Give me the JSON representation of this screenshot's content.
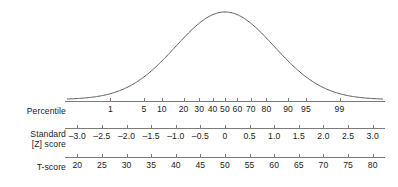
{
  "chart_data": {
    "type": "line",
    "title": "",
    "subtitle": "",
    "xlabel": "",
    "ylabel": "",
    "grid": false,
    "legend": null,
    "curve": {
      "name": "normal-distribution",
      "mean_z": 0,
      "sd_z": 1,
      "xlim_z": [
        -3.2,
        3.2
      ],
      "color": "#5a5a5a",
      "filled": false
    },
    "series": [
      {
        "name": "Percentile",
        "values": [
          1,
          5,
          10,
          20,
          30,
          40,
          50,
          60,
          70,
          80,
          90,
          95,
          99
        ],
        "z_positions": [
          -2.326,
          -1.645,
          -1.282,
          -0.842,
          -0.524,
          -0.253,
          0,
          0.253,
          0.524,
          0.842,
          1.282,
          1.645,
          2.326
        ]
      },
      {
        "name": "Standard [Z] score",
        "values": [
          "–3.0",
          "–2.5",
          "–2.0",
          "–1.5",
          "–1.0",
          "–0.5",
          "0",
          "0.5",
          "1.0",
          "1.5",
          "2.0",
          "2.5",
          "3.0"
        ],
        "z_positions": [
          -3.0,
          -2.5,
          -2.0,
          -1.5,
          -1.0,
          -0.5,
          0,
          0.5,
          1.0,
          1.5,
          2.0,
          2.5,
          3.0
        ]
      },
      {
        "name": "T-score",
        "values": [
          20,
          25,
          30,
          35,
          40,
          45,
          50,
          55,
          60,
          65,
          70,
          75,
          80
        ],
        "z_positions": [
          -3.0,
          -2.5,
          -2.0,
          -1.5,
          -1.0,
          -0.5,
          0,
          0.5,
          1.0,
          1.5,
          2.0,
          2.5,
          3.0
        ]
      }
    ]
  },
  "rows": [
    {
      "id": "percentile",
      "label": "Percentile",
      "label_line2": "",
      "ticks": [
        {
          "value": "1",
          "z": -2.326
        },
        {
          "value": "5",
          "z": -1.645
        },
        {
          "value": "10",
          "z": -1.282
        },
        {
          "value": "20",
          "z": -0.842
        },
        {
          "value": "30",
          "z": -0.524
        },
        {
          "value": "40",
          "z": -0.253
        },
        {
          "value": "50",
          "z": 0
        },
        {
          "value": "60",
          "z": 0.253
        },
        {
          "value": "70",
          "z": 0.524
        },
        {
          "value": "80",
          "z": 0.842
        },
        {
          "value": "90",
          "z": 1.282
        },
        {
          "value": "95",
          "z": 1.645
        },
        {
          "value": "99",
          "z": 2.326
        }
      ]
    },
    {
      "id": "zscore",
      "label": "Standard",
      "label_line2": "[Z] score",
      "ticks": [
        {
          "value": "–3.0",
          "z": -3.0
        },
        {
          "value": "–2.5",
          "z": -2.5
        },
        {
          "value": "–2.0",
          "z": -2.0
        },
        {
          "value": "–1.5",
          "z": -1.5
        },
        {
          "value": "–1.0",
          "z": -1.0
        },
        {
          "value": "–0.5",
          "z": -0.5
        },
        {
          "value": "0",
          "z": 0
        },
        {
          "value": "0.5",
          "z": 0.5
        },
        {
          "value": "1.0",
          "z": 1.0
        },
        {
          "value": "1.5",
          "z": 1.5
        },
        {
          "value": "2.0",
          "z": 2.0
        },
        {
          "value": "2.5",
          "z": 2.5
        },
        {
          "value": "3.0",
          "z": 3.0
        }
      ]
    },
    {
      "id": "tscore",
      "label": "T-score",
      "label_line2": "",
      "ticks": [
        {
          "value": "20",
          "z": -3.0
        },
        {
          "value": "25",
          "z": -2.5
        },
        {
          "value": "30",
          "z": -2.0
        },
        {
          "value": "35",
          "z": -1.5
        },
        {
          "value": "40",
          "z": -1.0
        },
        {
          "value": "45",
          "z": -0.5
        },
        {
          "value": "50",
          "z": 0
        },
        {
          "value": "55",
          "z": 0.5
        },
        {
          "value": "60",
          "z": 1.0
        },
        {
          "value": "65",
          "z": 1.5
        },
        {
          "value": "70",
          "z": 2.0
        },
        {
          "value": "75",
          "z": 2.5
        },
        {
          "value": "80",
          "z": 3.0
        }
      ]
    }
  ],
  "colors": {
    "curve": "#5a5a5a",
    "rule": "#7b7b7b",
    "text": "#1a1a1a",
    "background": "#ffffff"
  },
  "geometry": {
    "axis_left_px": 65,
    "axis_width_px": 320,
    "z_min": -3.25,
    "z_max": 3.25
  }
}
